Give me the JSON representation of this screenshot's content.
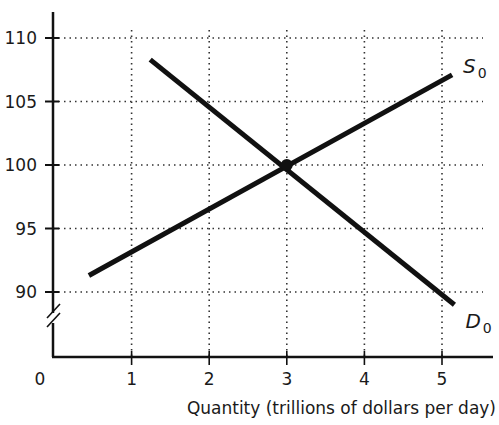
{
  "chart_data": {
    "type": "line",
    "xlabel": "Quantity (trillions of dollars per day)",
    "ylabel": "Exchange rate (yen per dollar)",
    "x_ticks": [
      1,
      2,
      3,
      4,
      5
    ],
    "x_origin_label": "0",
    "y_ticks": [
      90,
      95,
      100,
      105,
      110
    ],
    "xlim": [
      0,
      5.5
    ],
    "ylim": [
      87,
      111
    ],
    "grid": "dotted",
    "axis_break_on_y": true,
    "series": [
      {
        "name": "S0",
        "label": "S",
        "subscript": "0",
        "x": [
          0.45,
          5.13
        ],
        "y": [
          91.3,
          107.1
        ]
      },
      {
        "name": "D0",
        "label": "D",
        "subscript": "0",
        "x": [
          1.24,
          5.16
        ],
        "y": [
          108.3,
          89.0
        ]
      }
    ],
    "equilibrium": {
      "x": 3,
      "y": 100
    },
    "line_color": "#111111",
    "grid_color": "#333333"
  }
}
